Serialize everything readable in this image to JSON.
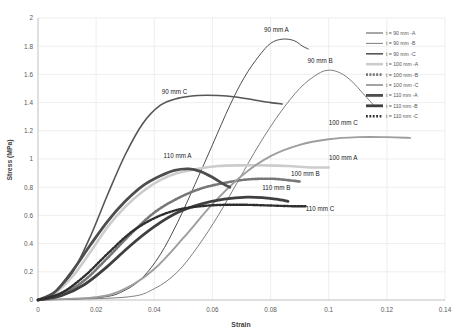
{
  "chart_data": {
    "type": "line",
    "title": "",
    "xlabel": "Strain",
    "ylabel": "Stress (MPa)",
    "xlim": [
      0,
      0.14
    ],
    "ylim": [
      0,
      2
    ],
    "xticks": [
      "0",
      "0.02",
      "0.04",
      "0.06",
      "0.08",
      "0.1",
      "0.12",
      "0.14"
    ],
    "yticks": [
      "0",
      "0.2",
      "0.4",
      "0.6",
      "0.8",
      "1",
      "1.2",
      "1.4",
      "1.6",
      "1.8",
      "2"
    ],
    "grid": true,
    "legend_position": "right",
    "legend": [
      {
        "label": "t = 90 mm -A",
        "color": "#3a3a3a",
        "width": 0.9,
        "dash": ""
      },
      {
        "label": "t = 90 mm -B",
        "color": "#6e6e6e",
        "width": 0.9,
        "dash": ""
      },
      {
        "label": "t = 90 mm -C",
        "color": "#565656",
        "width": 1.6,
        "dash": ""
      },
      {
        "label": "t = 100 mm -A",
        "color": "#cccccc",
        "width": 2.6,
        "dash": ""
      },
      {
        "label": "t = 100 mm -B",
        "color": "#777777",
        "width": 2.6,
        "dash": "2,1.4"
      },
      {
        "label": "t = 100 mm -C",
        "color": "#9e9e9e",
        "width": 1.9,
        "dash": ""
      },
      {
        "label": "t = 110 mm -A",
        "color": "#4d4d4d",
        "width": 2.8,
        "dash": ""
      },
      {
        "label": "t = 110 mm -B",
        "color": "#3f3f3f",
        "width": 2.8,
        "dash": ""
      },
      {
        "label": "t = 110 mm -C",
        "color": "#2e2e2e",
        "width": 2.4,
        "dash": "1.8,1.6"
      }
    ],
    "annotations": [
      {
        "text": "90 mm A",
        "x": 0.082,
        "y": 1.9
      },
      {
        "text": "90 mm B",
        "x": 0.097,
        "y": 1.68
      },
      {
        "text": "90 mm C",
        "x": 0.047,
        "y": 1.46
      },
      {
        "text": "100 mm C",
        "x": 0.105,
        "y": 1.24
      },
      {
        "text": "100 mm A",
        "x": 0.105,
        "y": 0.99
      },
      {
        "text": "110 mm A",
        "x": 0.048,
        "y": 1.01
      },
      {
        "text": "100 mm B",
        "x": 0.092,
        "y": 0.88
      },
      {
        "text": "110 mm B",
        "x": 0.082,
        "y": 0.78
      },
      {
        "text": "110 mm C",
        "x": 0.097,
        "y": 0.63
      }
    ],
    "series": [
      {
        "name": "t = 90 mm -A",
        "color": "#3a3a3a",
        "width": 0.9,
        "dash": "",
        "points": [
          [
            0,
            0
          ],
          [
            0.022,
            0.02
          ],
          [
            0.03,
            0.07
          ],
          [
            0.036,
            0.16
          ],
          [
            0.042,
            0.32
          ],
          [
            0.048,
            0.55
          ],
          [
            0.054,
            0.82
          ],
          [
            0.06,
            1.1
          ],
          [
            0.066,
            1.38
          ],
          [
            0.071,
            1.58
          ],
          [
            0.076,
            1.73
          ],
          [
            0.08,
            1.82
          ],
          [
            0.084,
            1.85
          ],
          [
            0.088,
            1.84
          ],
          [
            0.091,
            1.8
          ],
          [
            0.093,
            1.78
          ]
        ]
      },
      {
        "name": "t = 90 mm -B",
        "color": "#6e6e6e",
        "width": 0.9,
        "dash": "",
        "points": [
          [
            0,
            0
          ],
          [
            0.03,
            0.02
          ],
          [
            0.04,
            0.08
          ],
          [
            0.048,
            0.2
          ],
          [
            0.055,
            0.38
          ],
          [
            0.062,
            0.6
          ],
          [
            0.069,
            0.85
          ],
          [
            0.076,
            1.1
          ],
          [
            0.083,
            1.32
          ],
          [
            0.09,
            1.5
          ],
          [
            0.096,
            1.6
          ],
          [
            0.1,
            1.63
          ],
          [
            0.104,
            1.61
          ],
          [
            0.108,
            1.55
          ],
          [
            0.112,
            1.46
          ],
          [
            0.116,
            1.37
          ]
        ]
      },
      {
        "name": "t = 90 mm -C",
        "color": "#565656",
        "width": 1.6,
        "dash": "",
        "points": [
          [
            0,
            0
          ],
          [
            0.006,
            0.05
          ],
          [
            0.012,
            0.2
          ],
          [
            0.018,
            0.45
          ],
          [
            0.024,
            0.75
          ],
          [
            0.03,
            1.03
          ],
          [
            0.036,
            1.25
          ],
          [
            0.042,
            1.38
          ],
          [
            0.048,
            1.43
          ],
          [
            0.055,
            1.45
          ],
          [
            0.062,
            1.45
          ],
          [
            0.068,
            1.44
          ],
          [
            0.074,
            1.42
          ],
          [
            0.08,
            1.4
          ],
          [
            0.084,
            1.39
          ]
        ]
      },
      {
        "name": "t = 100 mm -A",
        "color": "#cccccc",
        "width": 2.6,
        "dash": "",
        "points": [
          [
            0,
            0
          ],
          [
            0.006,
            0.05
          ],
          [
            0.012,
            0.17
          ],
          [
            0.018,
            0.34
          ],
          [
            0.024,
            0.52
          ],
          [
            0.03,
            0.66
          ],
          [
            0.036,
            0.77
          ],
          [
            0.042,
            0.85
          ],
          [
            0.048,
            0.9
          ],
          [
            0.055,
            0.93
          ],
          [
            0.062,
            0.95
          ],
          [
            0.07,
            0.955
          ],
          [
            0.078,
            0.955
          ],
          [
            0.086,
            0.95
          ],
          [
            0.094,
            0.94
          ],
          [
            0.1,
            0.94
          ]
        ]
      },
      {
        "name": "t = 100 mm -B",
        "color": "#777777",
        "width": 2.6,
        "dash": "2,1.4",
        "points": [
          [
            0,
            0
          ],
          [
            0.008,
            0.04
          ],
          [
            0.016,
            0.14
          ],
          [
            0.024,
            0.3
          ],
          [
            0.032,
            0.47
          ],
          [
            0.04,
            0.62
          ],
          [
            0.048,
            0.72
          ],
          [
            0.056,
            0.79
          ],
          [
            0.064,
            0.83
          ],
          [
            0.072,
            0.855
          ],
          [
            0.08,
            0.86
          ],
          [
            0.086,
            0.85
          ],
          [
            0.09,
            0.84
          ]
        ]
      },
      {
        "name": "t = 100 mm -C",
        "color": "#9e9e9e",
        "width": 1.9,
        "dash": "",
        "points": [
          [
            0,
            0
          ],
          [
            0.02,
            0.02
          ],
          [
            0.03,
            0.08
          ],
          [
            0.04,
            0.22
          ],
          [
            0.05,
            0.44
          ],
          [
            0.06,
            0.68
          ],
          [
            0.07,
            0.88
          ],
          [
            0.08,
            1.02
          ],
          [
            0.09,
            1.1
          ],
          [
            0.1,
            1.14
          ],
          [
            0.11,
            1.155
          ],
          [
            0.12,
            1.155
          ],
          [
            0.128,
            1.15
          ]
        ]
      },
      {
        "name": "t = 110 mm -A",
        "color": "#4d4d4d",
        "width": 2.8,
        "dash": "",
        "points": [
          [
            0,
            0
          ],
          [
            0.006,
            0.06
          ],
          [
            0.012,
            0.21
          ],
          [
            0.018,
            0.39
          ],
          [
            0.024,
            0.56
          ],
          [
            0.03,
            0.7
          ],
          [
            0.036,
            0.81
          ],
          [
            0.042,
            0.88
          ],
          [
            0.047,
            0.92
          ],
          [
            0.052,
            0.93
          ],
          [
            0.056,
            0.91
          ],
          [
            0.06,
            0.87
          ],
          [
            0.064,
            0.82
          ],
          [
            0.066,
            0.8
          ]
        ]
      },
      {
        "name": "t = 110 mm -B",
        "color": "#3f3f3f",
        "width": 2.8,
        "dash": "",
        "points": [
          [
            0,
            0
          ],
          [
            0.008,
            0.03
          ],
          [
            0.016,
            0.11
          ],
          [
            0.024,
            0.24
          ],
          [
            0.032,
            0.39
          ],
          [
            0.04,
            0.52
          ],
          [
            0.048,
            0.62
          ],
          [
            0.056,
            0.68
          ],
          [
            0.064,
            0.715
          ],
          [
            0.072,
            0.73
          ],
          [
            0.078,
            0.725
          ],
          [
            0.082,
            0.715
          ],
          [
            0.086,
            0.7
          ]
        ]
      },
      {
        "name": "t = 110 mm -C",
        "color": "#2e2e2e",
        "width": 2.4,
        "dash": "1.8,1.6",
        "points": [
          [
            0,
            0
          ],
          [
            0.008,
            0.05
          ],
          [
            0.016,
            0.17
          ],
          [
            0.024,
            0.33
          ],
          [
            0.032,
            0.48
          ],
          [
            0.04,
            0.58
          ],
          [
            0.048,
            0.64
          ],
          [
            0.056,
            0.665
          ],
          [
            0.064,
            0.675
          ],
          [
            0.072,
            0.675
          ],
          [
            0.08,
            0.67
          ],
          [
            0.088,
            0.665
          ],
          [
            0.092,
            0.665
          ]
        ]
      }
    ]
  }
}
